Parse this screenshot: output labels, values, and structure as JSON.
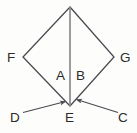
{
  "figure": {
    "type": "geometry-diagram",
    "background_color": "#fdfdfc",
    "stroke_color": "#4a4a52",
    "divider_color": "#8b8b90",
    "label_color": "#2b2b2b",
    "vertices": [
      {
        "name": "top-apex",
        "label": "",
        "x": 70,
        "y": 7
      },
      {
        "name": "left-vertex",
        "label": "F",
        "x": 23,
        "y": 57
      },
      {
        "name": "right-vertex",
        "label": "G",
        "x": 114,
        "y": 57
      },
      {
        "name": "bottom-vertex",
        "label": "E",
        "x": 70,
        "y": 106
      }
    ],
    "regions": [
      {
        "name": "region-a",
        "label": "A",
        "x": 60,
        "y": 76
      },
      {
        "name": "region-b",
        "label": "B",
        "x": 80,
        "y": 76
      }
    ],
    "arrows": [
      {
        "name": "arrow-from-d",
        "label": "D",
        "from_x": 23,
        "from_y": 112,
        "to_x": 67,
        "to_y": 101
      },
      {
        "name": "arrow-from-c",
        "label": "C",
        "from_x": 118,
        "from_y": 112,
        "to_x": 75,
        "to_y": 99
      }
    ],
    "labels": {
      "f": "F",
      "g": "G",
      "a": "A",
      "b": "B",
      "d": "D",
      "e": "E",
      "c": "C"
    }
  }
}
